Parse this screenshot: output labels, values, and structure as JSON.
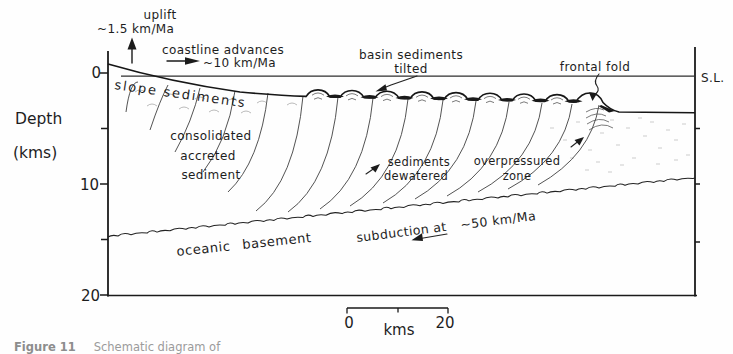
{
  "axes": {
    "depth_label": "Depth",
    "depth_units": "(kms)",
    "ticks": {
      "t0": "0",
      "t10": "10",
      "t20": "20"
    },
    "sea_level_label": "S.L."
  },
  "scalebar": {
    "start": "0",
    "unit": "kms",
    "end": "20"
  },
  "labels": {
    "uplift_line1": "uplift",
    "uplift_line2": "~1.5 km/Ma",
    "coastline_line1": "coastline advances",
    "coastline_line2": "~10 km/Ma",
    "basin_line1": "basin sediments",
    "basin_line2": "tilted",
    "frontal_fold": "frontal fold",
    "slope_sediments": "slope sediments",
    "accreted_line1": "consolidated",
    "accreted_line2": "accreted",
    "accreted_line3": "sediment",
    "dewatered_line1": "sediments",
    "dewatered_line2": "dewatered",
    "overpressured_line1": "overpressured",
    "overpressured_line2": "zone",
    "oceanic_basement": "oceanic basement",
    "subduction_line1": "subduction at",
    "subduction_rate": "~50 km/Ma"
  },
  "caption": {
    "figure_label": "Figure 11",
    "text": "Schematic diagram of"
  },
  "colors": {
    "ink": "#1b1b1b",
    "faint_ink": "#7c7c7c",
    "background": "#fefefe"
  }
}
